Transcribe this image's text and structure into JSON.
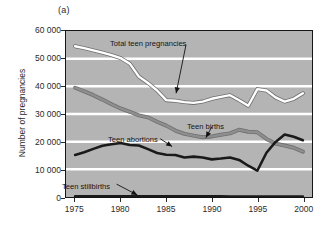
{
  "figure": {
    "panel_label": "(a)",
    "background_color": "#ffffff",
    "plot_background_color": "#b4b4b4",
    "gridline_color": "#ffffff",
    "frame_color": "#151515"
  },
  "chart_data": {
    "type": "line",
    "title": "",
    "subtitle": "",
    "xlabel": "",
    "ylabel": "Number of pregnancies",
    "xlim": [
      1974,
      2001
    ],
    "ylim": [
      0,
      60000
    ],
    "xticks": [
      1975,
      1980,
      1985,
      1990,
      1995,
      2000
    ],
    "xticklabels": [
      "1975",
      "1980",
      "1985",
      "1990",
      "1995",
      "2000"
    ],
    "yticks": [
      0,
      10000,
      20000,
      30000,
      40000,
      50000,
      60000
    ],
    "yticklabels": [
      "0",
      "10 000",
      "20 000",
      "30 000",
      "40 000",
      "50 000",
      "60 000"
    ],
    "grid": "horizontal",
    "legend": "none",
    "annotations_style": "inline labels with arrows",
    "x": [
      1975,
      1976,
      1977,
      1978,
      1979,
      1980,
      1981,
      1982,
      1983,
      1984,
      1985,
      1986,
      1987,
      1988,
      1989,
      1990,
      1991,
      1992,
      1993,
      1994,
      1995,
      1996,
      1997,
      1998,
      1999,
      2000
    ],
    "series": [
      {
        "name": "Total teen pregnancies",
        "color": "#ffffff",
        "label_text": "Total teen pregnancies",
        "values": [
          54500,
          53800,
          53000,
          52200,
          51300,
          50200,
          48200,
          43500,
          41200,
          38500,
          35000,
          34800,
          34300,
          34000,
          34500,
          35500,
          36200,
          36800,
          35000,
          33000,
          39000,
          38500,
          36000,
          34500,
          35500,
          37500
        ]
      },
      {
        "name": "Teen births",
        "color": "#8e8e8e",
        "label_text": "Teen births",
        "values": [
          39500,
          38200,
          36800,
          35200,
          33500,
          32000,
          30800,
          29500,
          28800,
          27200,
          25800,
          24000,
          22800,
          22200,
          21600,
          21900,
          22500,
          23000,
          24300,
          23600,
          23400,
          21000,
          19300,
          18600,
          17800,
          16400
        ]
      },
      {
        "name": "Teen abortions",
        "color": "#1a1a1a",
        "label_text": "Teen abortions",
        "values": [
          15200,
          16200,
          17400,
          18500,
          19100,
          19500,
          18800,
          18600,
          17300,
          15900,
          15300,
          15200,
          14300,
          14600,
          14300,
          13600,
          13900,
          14300,
          13400,
          11300,
          9500,
          16000,
          19900,
          22600,
          21800,
          20500
        ]
      },
      {
        "name": "Teen stillbirths",
        "color": "#1a1a1a",
        "label_text": "Teen stillbirths",
        "values": [
          300,
          290,
          280,
          280,
          270,
          270,
          260,
          260,
          250,
          250,
          240,
          240,
          230,
          230,
          220,
          220,
          220,
          210,
          210,
          200,
          200,
          200,
          190,
          190,
          180,
          180
        ]
      }
    ],
    "annotations": [
      {
        "text": "Total teen pregnancies",
        "label_x": 110,
        "label_y": 39,
        "arrow_from_x": 186,
        "arrow_from_y": 44,
        "arrow_to_x": 176,
        "arrow_to_y": 93
      },
      {
        "text": "Teen births",
        "label_x": 187,
        "label_y": 122,
        "arrow_from_x": 212,
        "arrow_from_y": 127,
        "arrow_to_x": 206,
        "arrow_to_y": 138
      },
      {
        "text": "Teen abortions",
        "label_x": 108,
        "label_y": 135,
        "arrow_from_x": 160,
        "arrow_from_y": 139,
        "arrow_to_x": 172,
        "arrow_to_y": 147
      },
      {
        "text": "Teen stillbirths",
        "label_x": 62,
        "label_y": 182,
        "arrow_from_x": 116,
        "arrow_from_y": 185,
        "arrow_to_x": 137,
        "arrow_to_y": 196
      }
    ]
  }
}
